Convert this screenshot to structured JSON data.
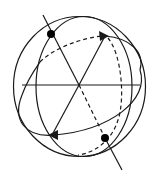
{
  "diagram": {
    "title": "",
    "type": "sphere-great-circles",
    "stroke_color": "#1a1a1a",
    "background": "#ffffff",
    "elements": {
      "sphere_outline": "outer circle",
      "vertical_great_circle": "ellipse",
      "tilted_great_circle_front": "solid arc",
      "tilted_great_circle_back": "dashed arc",
      "axis": "line through poles",
      "axis_hidden_segment": "dashed",
      "horizontal_diameter": "line",
      "pole_points": 2,
      "arrows": 2
    }
  }
}
